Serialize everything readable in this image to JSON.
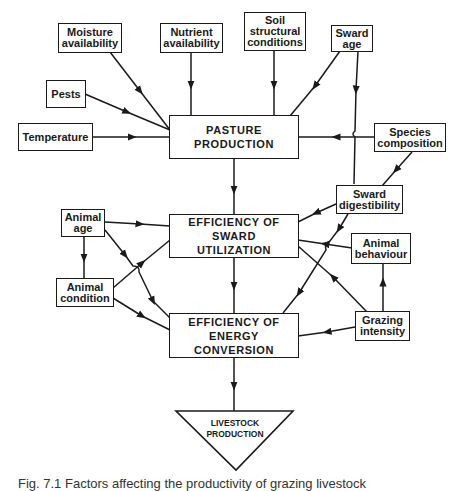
{
  "diagram": {
    "nodes": {
      "moisture": "Moisture availability",
      "nutrient": "Nutrient availability",
      "soil": "Soil structural conditions",
      "sward_age": "Sward age",
      "pests": "Pests",
      "temperature": "Temperature",
      "pasture": "PASTURE PRODUCTION",
      "species": "Species composition",
      "digestibility": "Sward digestibility",
      "animal_age": "Animal age",
      "utilization": "EFFICIENCY OF SWARD UTILIZATION",
      "behaviour": "Animal behaviour",
      "condition": "Animal condition",
      "conversion": "EFFICIENCY OF ENERGY CONVERSION",
      "grazing": "Grazing intensity",
      "livestock": "LIVESTOCK PRODUCTION"
    },
    "edges": [
      [
        "Moisture availability",
        "PASTURE PRODUCTION"
      ],
      [
        "Nutrient availability",
        "PASTURE PRODUCTION"
      ],
      [
        "Soil structural conditions",
        "PASTURE PRODUCTION"
      ],
      [
        "Sward age",
        "PASTURE PRODUCTION"
      ],
      [
        "Sward age",
        "Sward digestibility"
      ],
      [
        "Pests",
        "PASTURE PRODUCTION"
      ],
      [
        "Temperature",
        "PASTURE PRODUCTION"
      ],
      [
        "Species composition",
        "PASTURE PRODUCTION"
      ],
      [
        "Species composition",
        "Sward digestibility"
      ],
      [
        "PASTURE PRODUCTION",
        "EFFICIENCY OF SWARD UTILIZATION"
      ],
      [
        "Sward digestibility",
        "EFFICIENCY OF SWARD UTILIZATION"
      ],
      [
        "Sward digestibility",
        "EFFICIENCY OF ENERGY CONVERSION"
      ],
      [
        "Animal age",
        "EFFICIENCY OF SWARD UTILIZATION"
      ],
      [
        "Animal age",
        "Animal condition"
      ],
      [
        "Animal age",
        "EFFICIENCY OF ENERGY CONVERSION"
      ],
      [
        "Animal condition",
        "EFFICIENCY OF SWARD UTILIZATION"
      ],
      [
        "Animal condition",
        "EFFICIENCY OF ENERGY CONVERSION"
      ],
      [
        "Animal behaviour",
        "EFFICIENCY OF SWARD UTILIZATION"
      ],
      [
        "Grazing intensity",
        "Animal behaviour"
      ],
      [
        "Grazing intensity",
        "EFFICIENCY OF SWARD UTILIZATION"
      ],
      [
        "Grazing intensity",
        "EFFICIENCY OF ENERGY CONVERSION"
      ],
      [
        "EFFICIENCY OF SWARD UTILIZATION",
        "EFFICIENCY OF ENERGY CONVERSION"
      ],
      [
        "EFFICIENCY OF ENERGY CONVERSION",
        "LIVESTOCK PRODUCTION"
      ]
    ]
  },
  "caption": "Fig. 7.1  Factors affecting the productivity of grazing livestock"
}
